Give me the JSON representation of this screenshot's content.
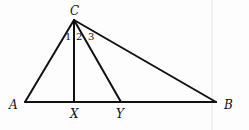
{
  "diagram": {
    "type": "geometry-triangle",
    "points": {
      "A": {
        "label": "A",
        "x": 25,
        "y": 102
      },
      "B": {
        "label": "B",
        "x": 216,
        "y": 102
      },
      "C": {
        "label": "C",
        "x": 74,
        "y": 20
      },
      "X": {
        "label": "X",
        "x": 74,
        "y": 102
      },
      "Y": {
        "label": "Y",
        "x": 121,
        "y": 102
      }
    },
    "segments": [
      "AB",
      "AC",
      "BC",
      "CX",
      "CY"
    ],
    "angle_labels": {
      "a1": "1",
      "a2": "2",
      "a3": "3"
    },
    "line_color": "#111111"
  }
}
